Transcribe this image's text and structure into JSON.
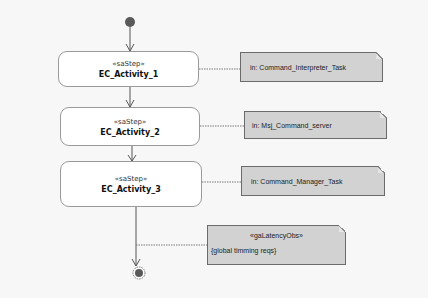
{
  "diagram": {
    "type": "activity",
    "colors": {
      "background": "#f7f7f7",
      "activity_fill": "#ffffff",
      "activity_border": "#9a9a9a",
      "note_fill": "#d2d2d2",
      "note_border": "#6b6b6b",
      "node_fill": "#555555",
      "edge": "#555555"
    },
    "initial_node": {
      "label": ""
    },
    "activities": [
      {
        "stereotype": "«saStep»",
        "name": "EC_Activity_1"
      },
      {
        "stereotype": "«saStep»",
        "name": "EC_Activity_2"
      },
      {
        "stereotype": "«saStep»",
        "name": "EC_Activity_3"
      }
    ],
    "notes": [
      {
        "text": "in: Command_Interpreter_Task"
      },
      {
        "text": "in: Msj_Command_server"
      },
      {
        "text": "in: Command_Manager_Task"
      }
    ],
    "latency_note": {
      "stereotype": "«gaLatencyObs»",
      "text": "{global timming reqs}"
    },
    "final_node": {
      "label": ""
    }
  }
}
